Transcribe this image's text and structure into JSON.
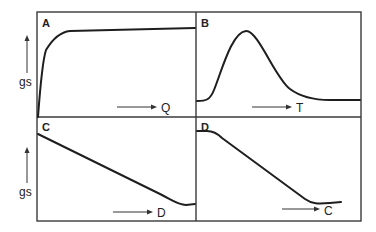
{
  "figure": {
    "y_axis_label": "gs",
    "panels": [
      {
        "id": "A",
        "label": "A",
        "x_variable": "Q",
        "shape": "rapid rise then near-plateau (saturating)"
      },
      {
        "id": "B",
        "label": "B",
        "x_variable": "T",
        "shape": "bell-shaped peak then low plateau"
      },
      {
        "id": "C",
        "label": "C",
        "x_variable": "D",
        "shape": "steady decline then level off"
      },
      {
        "id": "D",
        "label": "D",
        "x_variable": "C",
        "shape": "plateau, steep decline, then level off"
      }
    ]
  }
}
